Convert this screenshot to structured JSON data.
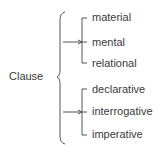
{
  "diagram": {
    "root": {
      "label": "Clause"
    },
    "groups": [
      {
        "name": "transitivity",
        "options": [
          "material",
          "mental",
          "relational"
        ]
      },
      {
        "name": "mood",
        "options": [
          "declarative",
          "interrogative",
          "imperative"
        ]
      }
    ],
    "colors": {
      "line": "#4a4a4a",
      "text": "#3a3a3a",
      "background": "#ffffff"
    }
  }
}
